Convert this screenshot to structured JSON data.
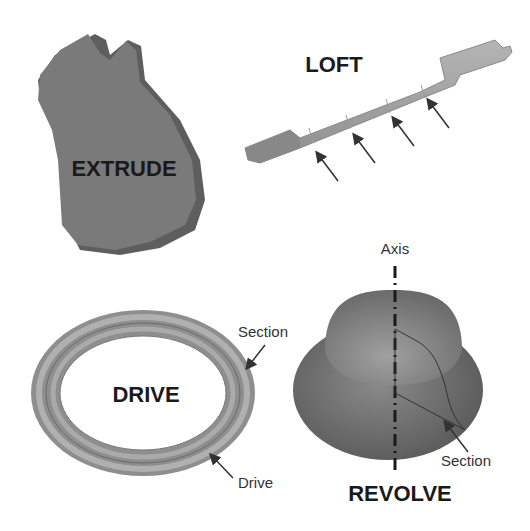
{
  "diagram": {
    "panels": [
      {
        "id": "extrude",
        "title": "EXTRUDE",
        "annotations": []
      },
      {
        "id": "loft",
        "title": "LOFT",
        "annotations": [],
        "section_arrows": 4
      },
      {
        "id": "drive",
        "title": "DRIVE",
        "annotations": [
          "Section",
          "Drive"
        ]
      },
      {
        "id": "revolve",
        "title": "REVOLVE",
        "annotations": [
          "Axis",
          "Section"
        ]
      }
    ]
  },
  "colors": {
    "background": "#ffffff",
    "solid_gray": "#7a7a7a",
    "solid_side": "#5e5e5e",
    "text": "#1a1a1a",
    "annotation_text": "#333333"
  }
}
